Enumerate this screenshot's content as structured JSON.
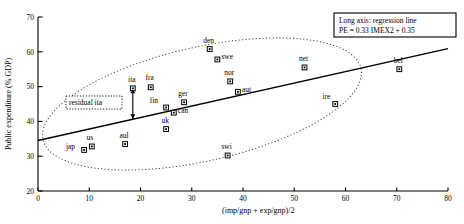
{
  "chart_data": {
    "type": "scatter",
    "title": "",
    "xlabel": "(imp/gnp + exp/gnp)/2",
    "ylabel": "Public expenditure (% GDP)",
    "xlim": [
      0,
      80
    ],
    "ylim": [
      20,
      70
    ],
    "xticks": [
      0,
      10,
      20,
      30,
      40,
      50,
      60,
      70,
      80
    ],
    "yticks": [
      20,
      30,
      40,
      50,
      60,
      70
    ],
    "grid": false,
    "legend_position": "top-right",
    "points": [
      {
        "label": "jap",
        "x": 9.0,
        "y": 31.8,
        "lx": -9,
        "ly": 1
      },
      {
        "label": "us",
        "x": 10.5,
        "y": 32.8,
        "lx": -2,
        "ly": -5
      },
      {
        "label": "aul",
        "x": 17.0,
        "y": 33.5,
        "lx": -1,
        "ly": -5
      },
      {
        "label": "uk",
        "x": 25.0,
        "y": 37.8,
        "lx": -1,
        "ly": -5
      },
      {
        "label": "can",
        "x": 26.5,
        "y": 42.5,
        "lx": 4,
        "ly": 2
      },
      {
        "label": "fin",
        "x": 25.0,
        "y": 44.0,
        "lx": -8,
        "ly": -3
      },
      {
        "label": "ger",
        "x": 28.5,
        "y": 45.5,
        "lx": -1,
        "ly": -5
      },
      {
        "label": "ita",
        "x": 18.5,
        "y": 49.5,
        "lx": -1,
        "ly": -5
      },
      {
        "label": "fra",
        "x": 22.0,
        "y": 49.8,
        "lx": -1,
        "ly": -6
      },
      {
        "label": "swi",
        "x": 37.0,
        "y": 30.2,
        "lx": -1,
        "ly": -5
      },
      {
        "label": "nor",
        "x": 37.5,
        "y": 51.5,
        "lx": -1,
        "ly": -5
      },
      {
        "label": "aut",
        "x": 39.0,
        "y": 48.5,
        "lx": 4,
        "ly": 2
      },
      {
        "label": "den",
        "x": 33.5,
        "y": 60.8,
        "lx": -1,
        "ly": -5
      },
      {
        "label": "swe",
        "x": 35.0,
        "y": 57.8,
        "lx": 4,
        "ly": 1
      },
      {
        "label": "net",
        "x": 52.0,
        "y": 55.5,
        "lx": -1,
        "ly": -5
      },
      {
        "label": "ire",
        "x": 58.0,
        "y": 45.0,
        "lx": -5,
        "ly": -4
      },
      {
        "label": "bel",
        "x": 70.5,
        "y": 55.0,
        "lx": -1,
        "ly": -5
      }
    ],
    "regression": {
      "slope": 0.33,
      "intercept": 34.5,
      "x_start": 0,
      "x_end": 80
    },
    "ellipse": {
      "style": "dotted",
      "description": "concentration ellipse around data cloud"
    },
    "annotations": {
      "residual_label": "residual ita"
    }
  },
  "legend": {
    "line1": "Long axis: regression line",
    "line2": "PE = 0.33 IMEX2 + 0.35"
  }
}
